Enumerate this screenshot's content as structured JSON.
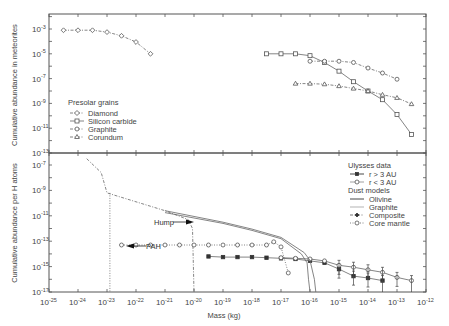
{
  "chart_data": [
    {
      "type": "line",
      "panel": "top",
      "title": "",
      "xlabel": "Mass (kg)",
      "ylabel": "Cumulative abundance in meteorites",
      "xscale": "log",
      "yscale": "log",
      "xlim": [
        1e-25,
        1e-12
      ],
      "ylim": [
        1e-13,
        0.01
      ],
      "y_ticks": [
        "10^-3",
        "10^-5",
        "10^-7",
        "10^-9",
        "10^-11",
        "10^-13"
      ],
      "legend_title": "Presolar grains",
      "legend_position": "lower-left",
      "series": [
        {
          "name": "Diamond",
          "marker": "diamond",
          "line": "dashdot",
          "log_x": [
            -24.5,
            -24.0,
            -23.5,
            -23.0,
            -22.5,
            -22.0,
            -21.5
          ],
          "log_y": [
            -3.1,
            -3.1,
            -3.1,
            -3.25,
            -3.55,
            -4.05,
            -5.0
          ]
        },
        {
          "name": "Silicon carbide",
          "marker": "square",
          "line": "solid",
          "log_x": [
            -17.5,
            -17.0,
            -16.5,
            -16.0,
            -15.5,
            -15.0,
            -14.5,
            -14.0,
            -13.5,
            -13.0,
            -12.5
          ],
          "log_y": [
            -5.0,
            -5.0,
            -5.0,
            -5.15,
            -5.7,
            -6.4,
            -7.25,
            -8.0,
            -8.7,
            -9.9,
            -11.5
          ]
        },
        {
          "name": "Graphite",
          "marker": "circle",
          "line": "dashdot",
          "log_x": [
            -16.0,
            -15.5,
            -15.0,
            -14.5,
            -14.0,
            -13.5,
            -13.0
          ],
          "log_y": [
            -5.6,
            -5.6,
            -5.6,
            -5.7,
            -6.15,
            -6.55,
            -7.05
          ]
        },
        {
          "name": "Corundum",
          "marker": "triangle",
          "line": "dashdot",
          "log_x": [
            -16.5,
            -16.0,
            -15.5,
            -15.0,
            -14.5,
            -14.0,
            -13.5,
            -13.0,
            -12.5
          ],
          "log_y": [
            -7.4,
            -7.4,
            -7.45,
            -7.6,
            -7.8,
            -8.0,
            -8.3,
            -8.55,
            -9.05
          ]
        }
      ]
    },
    {
      "type": "line",
      "panel": "bottom",
      "title": "",
      "xlabel": "Mass (kg)",
      "ylabel": "Cumulative abundance per H atoms",
      "xscale": "log",
      "yscale": "log",
      "xlim": [
        1e-25,
        1e-12
      ],
      "ylim": [
        1e-17,
        1e-06
      ],
      "x_ticks": [
        "10^-25",
        "10^-24",
        "10^-23",
        "10^-22",
        "10^-21",
        "10^-20",
        "10^-19",
        "10^-18",
        "10^-17",
        "10^-16",
        "10^-15",
        "10^-14",
        "10^-13",
        "10^-12"
      ],
      "y_ticks": [
        "10^-7",
        "10^-9",
        "10^-11",
        "10^-13",
        "10^-15",
        "10^-17"
      ],
      "legend_position": "upper-right",
      "legend_groups": [
        {
          "title": "Ulysses data",
          "entries": [
            "r > 3 AU",
            "r < 3 AU"
          ]
        },
        {
          "title": "Dust models",
          "entries": [
            "Olivine",
            "Graphite",
            "Composite",
            "Core mantle"
          ]
        }
      ],
      "annotations": [
        {
          "text": "Hump",
          "arrow": "right",
          "log_x": -20.1,
          "log_y": -11.5
        },
        {
          "text": "PAH",
          "arrow": "left",
          "log_x": -22.9,
          "log_y": -13.5
        }
      ],
      "series": [
        {
          "name": "r > 3 AU",
          "group": "Ulysses data",
          "marker": "filled-square",
          "line": "solid",
          "log_x": [
            -19.5,
            -19.0,
            -18.5,
            -18.0,
            -17.5,
            -17.0,
            -16.5,
            -16.0,
            -15.5,
            -15.0,
            -14.5,
            -14.0,
            -13.5
          ],
          "log_y": [
            -14.2,
            -14.25,
            -14.25,
            -14.25,
            -14.3,
            -14.35,
            -14.4,
            -14.55,
            -14.7,
            -15.2,
            -15.75,
            -15.9,
            -16.1
          ]
        },
        {
          "name": "r < 3 AU",
          "group": "Ulysses data",
          "marker": "circle",
          "line": "solid",
          "log_x": [
            -17.0,
            -16.5,
            -16.0,
            -15.5,
            -15.0,
            -14.5,
            -14.0,
            -13.5,
            -13.0,
            -12.5
          ],
          "log_y": [
            -14.3,
            -14.35,
            -14.4,
            -14.55,
            -14.9,
            -15.05,
            -15.25,
            -15.45,
            -15.85,
            -16.1
          ]
        },
        {
          "name": "Olivine",
          "group": "Dust models",
          "line": "solid",
          "log_x": [
            -21.0,
            -19.0,
            -18.0,
            -17.0,
            -16.2,
            -16.0,
            -15.85,
            -15.8
          ],
          "log_y": [
            -10.6,
            -11.5,
            -12.05,
            -12.7,
            -13.9,
            -14.5,
            -16.0,
            -17.0
          ]
        },
        {
          "name": "Graphite",
          "group": "Dust models",
          "line": "solid-light",
          "log_x": [
            -21.0,
            -19.0,
            -18.0,
            -17.0,
            -16.3,
            -16.1,
            -16.05,
            -16.0
          ],
          "log_y": [
            -10.75,
            -11.6,
            -12.15,
            -12.8,
            -14.0,
            -14.7,
            -16.0,
            -17.0
          ]
        },
        {
          "name": "Composite",
          "group": "Dust models",
          "line": "dashdot",
          "log_x": [
            -23.7,
            -23.2,
            -23.0,
            -22.0,
            -21.0,
            -20.2,
            -20.05,
            -20.0
          ],
          "log_y": [
            -6.5,
            -7.6,
            -9.2,
            -9.9,
            -10.6,
            -11.3,
            -12.0,
            -17.0
          ]
        },
        {
          "name": "PAH",
          "group": "Dust models",
          "line": "dotted",
          "log_x": [
            -22.9,
            -22.9
          ],
          "log_y": [
            -9.2,
            -17.0
          ]
        },
        {
          "name": "Core mantle",
          "group": "Dust models",
          "marker": "circle",
          "line": "dotted",
          "log_x": [
            -22.5,
            -22.0,
            -21.5,
            -21.0,
            -20.5,
            -20.0,
            -19.5,
            -19.0,
            -18.5,
            -18.0,
            -17.5,
            -17.25,
            -17.0,
            -16.75
          ],
          "log_y": [
            -13.3,
            -13.3,
            -13.3,
            -13.3,
            -13.3,
            -13.3,
            -13.3,
            -13.3,
            -13.3,
            -13.3,
            -13.3,
            -13.05,
            -13.45,
            -15.5
          ]
        }
      ]
    }
  ],
  "axes": {
    "x_title": "Mass (kg)",
    "top_y_title": "Cumulative abundance in meteorites",
    "bottom_y_title": "Cumulative abundance per H atoms"
  },
  "legend_top": {
    "title": "Presolar grains",
    "items": [
      "Diamond",
      "Silicon carbide",
      "Graphite",
      "Corundum"
    ]
  },
  "legend_bottom": {
    "group1_title": "Ulysses data",
    "group1_items": [
      "r > 3 AU",
      "r < 3 AU"
    ],
    "group2_title": "Dust models",
    "group2_items": [
      "Olivine",
      "Graphite",
      "Composite",
      "Core mantle"
    ]
  },
  "annotations": {
    "hump": "Hump",
    "pah": "PAH"
  }
}
